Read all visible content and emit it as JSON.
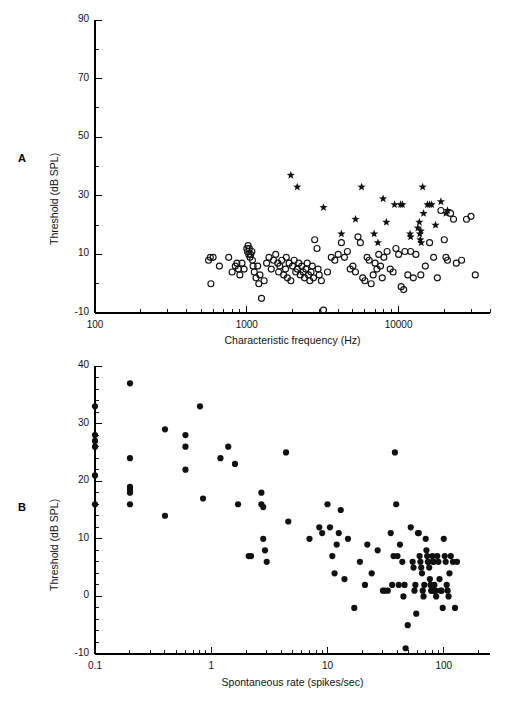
{
  "figure": {
    "panels": [
      {
        "letter": "A",
        "chart_index": 0
      },
      {
        "letter": "B",
        "chart_index": 1
      }
    ]
  },
  "chart_data": [
    {
      "type": "scatter",
      "panel": "A",
      "title": "",
      "xlabel": "Characteristic frequency (Hz)",
      "ylabel": "Threshold (dB SPL)",
      "xscale": "log",
      "yscale": "linear",
      "xlim": [
        100,
        40000
      ],
      "ylim": [
        -10,
        90
      ],
      "xticks": [
        100,
        1000,
        10000
      ],
      "xticklabels": [
        "100",
        "1000",
        "10000"
      ],
      "yticks": [
        -10,
        10,
        30,
        50,
        70,
        90
      ],
      "yticklabels": [
        "-10",
        "10",
        "30",
        "50",
        "70",
        "90"
      ],
      "yminor_step": 10,
      "grid": false,
      "legend": "none",
      "series": [
        {
          "name": "open-circle",
          "marker": "open-circle",
          "points": [
            [
              560,
              8
            ],
            [
              575,
              9
            ],
            [
              580,
              0
            ],
            [
              600,
              9
            ],
            [
              660,
              6
            ],
            [
              760,
              9
            ],
            [
              800,
              4
            ],
            [
              840,
              6
            ],
            [
              860,
              7
            ],
            [
              880,
              5
            ],
            [
              900,
              3
            ],
            [
              930,
              7
            ],
            [
              960,
              5
            ],
            [
              1000,
              12
            ],
            [
              1010,
              11
            ],
            [
              1020,
              13
            ],
            [
              1030,
              10
            ],
            [
              1040,
              12
            ],
            [
              1050,
              9
            ],
            [
              1060,
              10
            ],
            [
              1080,
              11
            ],
            [
              1090,
              8
            ],
            [
              1100,
              6
            ],
            [
              1120,
              4
            ],
            [
              1150,
              2
            ],
            [
              1180,
              6
            ],
            [
              1200,
              0
            ],
            [
              1220,
              3
            ],
            [
              1250,
              -5
            ],
            [
              1300,
              1
            ],
            [
              1350,
              7
            ],
            [
              1400,
              9
            ],
            [
              1450,
              5
            ],
            [
              1500,
              8
            ],
            [
              1550,
              10
            ],
            [
              1600,
              7
            ],
            [
              1620,
              4
            ],
            [
              1650,
              6
            ],
            [
              1700,
              8
            ],
            [
              1750,
              3
            ],
            [
              1800,
              5
            ],
            [
              1820,
              9
            ],
            [
              1850,
              2
            ],
            [
              1900,
              7
            ],
            [
              1950,
              1
            ],
            [
              2000,
              6
            ],
            [
              2050,
              8
            ],
            [
              2100,
              4
            ],
            [
              2150,
              5
            ],
            [
              2200,
              7
            ],
            [
              2250,
              3
            ],
            [
              2300,
              6
            ],
            [
              2350,
              4
            ],
            [
              2400,
              2
            ],
            [
              2450,
              5
            ],
            [
              2500,
              7
            ],
            [
              2550,
              3
            ],
            [
              2600,
              1
            ],
            [
              2650,
              4
            ],
            [
              2700,
              6
            ],
            [
              2750,
              2
            ],
            [
              2800,
              15
            ],
            [
              2900,
              12
            ],
            [
              2950,
              5
            ],
            [
              3000,
              3
            ],
            [
              3100,
              1
            ],
            [
              3200,
              -9
            ],
            [
              3400,
              4
            ],
            [
              3600,
              9
            ],
            [
              3800,
              8
            ],
            [
              4000,
              10
            ],
            [
              4200,
              14
            ],
            [
              4400,
              9
            ],
            [
              4600,
              11
            ],
            [
              4800,
              5
            ],
            [
              5000,
              6
            ],
            [
              5200,
              4
            ],
            [
              5400,
              16
            ],
            [
              5600,
              14
            ],
            [
              5800,
              2
            ],
            [
              6000,
              1
            ],
            [
              6200,
              9
            ],
            [
              6400,
              8
            ],
            [
              6600,
              0
            ],
            [
              6800,
              3
            ],
            [
              7000,
              7
            ],
            [
              7200,
              5
            ],
            [
              7400,
              10
            ],
            [
              7600,
              6
            ],
            [
              7800,
              2
            ],
            [
              8000,
              9
            ],
            [
              8400,
              11
            ],
            [
              8800,
              5
            ],
            [
              9200,
              4
            ],
            [
              9600,
              12
            ],
            [
              10000,
              10
            ],
            [
              10400,
              -1
            ],
            [
              10800,
              -2
            ],
            [
              11000,
              11
            ],
            [
              11500,
              3
            ],
            [
              12000,
              11
            ],
            [
              12500,
              2
            ],
            [
              13000,
              10
            ],
            [
              14000,
              3
            ],
            [
              15000,
              6
            ],
            [
              16000,
              14
            ],
            [
              17000,
              9
            ],
            [
              18000,
              2
            ],
            [
              19000,
              25
            ],
            [
              20000,
              15
            ],
            [
              20500,
              9
            ],
            [
              21000,
              8
            ],
            [
              22000,
              24
            ],
            [
              23000,
              22
            ],
            [
              24000,
              7
            ],
            [
              26000,
              8
            ],
            [
              28000,
              22
            ],
            [
              30000,
              23
            ],
            [
              32000,
              3
            ]
          ]
        },
        {
          "name": "star",
          "marker": "star",
          "points": [
            [
              1950,
              37
            ],
            [
              2150,
              33
            ],
            [
              3200,
              26
            ],
            [
              4200,
              17
            ],
            [
              5200,
              22
            ],
            [
              5700,
              33
            ],
            [
              6900,
              17
            ],
            [
              7300,
              14
            ],
            [
              7900,
              29
            ],
            [
              8300,
              21
            ],
            [
              9400,
              27
            ],
            [
              10300,
              27
            ],
            [
              10600,
              27
            ],
            [
              11900,
              17
            ],
            [
              12000,
              16
            ],
            [
              13400,
              19
            ],
            [
              13700,
              21
            ],
            [
              13800,
              17
            ],
            [
              13900,
              15
            ],
            [
              14000,
              18
            ],
            [
              14100,
              14
            ],
            [
              14400,
              33
            ],
            [
              14600,
              24
            ],
            [
              15500,
              27
            ],
            [
              16000,
              27
            ],
            [
              16500,
              27
            ],
            [
              17500,
              20
            ],
            [
              19000,
              28
            ],
            [
              20500,
              24
            ],
            [
              21000,
              25
            ]
          ]
        }
      ]
    },
    {
      "type": "scatter",
      "panel": "B",
      "title": "",
      "xlabel": "Spontaneous rate (spikes/sec)",
      "ylabel": "Threshold (dB SPL)",
      "xscale": "log",
      "yscale": "linear",
      "xlim": [
        0.1,
        250
      ],
      "ylim": [
        -10,
        40
      ],
      "xticks": [
        0.1,
        1,
        10,
        100
      ],
      "xticklabels": [
        "0.1",
        "1",
        "10",
        "100"
      ],
      "yticks": [
        -10,
        0,
        10,
        20,
        30,
        40
      ],
      "yticklabels": [
        "-10",
        "0",
        "10",
        "20",
        "30",
        "40"
      ],
      "yminor_step": 2,
      "grid": false,
      "legend": "none",
      "series": [
        {
          "name": "filled-circle",
          "marker": "filled-circle",
          "points": [
            [
              0.1,
              33
            ],
            [
              0.1,
              28
            ],
            [
              0.1,
              27
            ],
            [
              0.1,
              26
            ],
            [
              0.1,
              21
            ],
            [
              0.1,
              16
            ],
            [
              0.2,
              37
            ],
            [
              0.2,
              24
            ],
            [
              0.2,
              19
            ],
            [
              0.2,
              18.5
            ],
            [
              0.2,
              18
            ],
            [
              0.2,
              16
            ],
            [
              0.4,
              29
            ],
            [
              0.4,
              14
            ],
            [
              0.6,
              28
            ],
            [
              0.6,
              26
            ],
            [
              0.6,
              22
            ],
            [
              0.8,
              33
            ],
            [
              0.85,
              17
            ],
            [
              1.2,
              24
            ],
            [
              1.4,
              26
            ],
            [
              1.6,
              23
            ],
            [
              1.7,
              16
            ],
            [
              2.1,
              7
            ],
            [
              2.2,
              7
            ],
            [
              2.7,
              18
            ],
            [
              2.7,
              16
            ],
            [
              2.8,
              15.5
            ],
            [
              2.8,
              10
            ],
            [
              2.9,
              8
            ],
            [
              3.0,
              6
            ],
            [
              4.4,
              25
            ],
            [
              4.6,
              13
            ],
            [
              7.0,
              10
            ],
            [
              8.5,
              12
            ],
            [
              9.0,
              11
            ],
            [
              10.0,
              16
            ],
            [
              10.5,
              12
            ],
            [
              11.0,
              7
            ],
            [
              11.5,
              4
            ],
            [
              12.0,
              9
            ],
            [
              12.5,
              11
            ],
            [
              13.0,
              15
            ],
            [
              14.0,
              3
            ],
            [
              15.0,
              10
            ],
            [
              17.0,
              -2
            ],
            [
              19.0,
              6
            ],
            [
              21.0,
              2
            ],
            [
              22.0,
              9
            ],
            [
              24.0,
              4
            ],
            [
              27.0,
              8
            ],
            [
              30.0,
              1
            ],
            [
              31.0,
              1
            ],
            [
              33.0,
              1
            ],
            [
              35.0,
              11
            ],
            [
              36.0,
              2
            ],
            [
              37.0,
              7
            ],
            [
              38.0,
              25
            ],
            [
              39.0,
              16
            ],
            [
              40.0,
              7
            ],
            [
              41.0,
              2
            ],
            [
              42.0,
              9
            ],
            [
              44.0,
              6
            ],
            [
              45.0,
              0
            ],
            [
              46.0,
              2
            ],
            [
              47.0,
              -9
            ],
            [
              49.0,
              -5
            ],
            [
              52.0,
              12
            ],
            [
              54.0,
              6
            ],
            [
              55.0,
              5
            ],
            [
              56.0,
              1
            ],
            [
              57.0,
              2
            ],
            [
              58.0,
              -3
            ],
            [
              60.0,
              11
            ],
            [
              61.0,
              11
            ],
            [
              62.0,
              7
            ],
            [
              63.0,
              6
            ],
            [
              64.0,
              5
            ],
            [
              65.0,
              4
            ],
            [
              66.0,
              1
            ],
            [
              67.0,
              0
            ],
            [
              68.0,
              2
            ],
            [
              70.0,
              10
            ],
            [
              71.0,
              8
            ],
            [
              72.0,
              7
            ],
            [
              73.0,
              6
            ],
            [
              74.0,
              6
            ],
            [
              75.0,
              5
            ],
            [
              76.0,
              3
            ],
            [
              77.0,
              2
            ],
            [
              78.0,
              1
            ],
            [
              79.0,
              1
            ],
            [
              80.0,
              7
            ],
            [
              81.0,
              6
            ],
            [
              82.0,
              6
            ],
            [
              83.0,
              2
            ],
            [
              84.0,
              1
            ],
            [
              85.0,
              1
            ],
            [
              86.0,
              0
            ],
            [
              88.0,
              7
            ],
            [
              90.0,
              6
            ],
            [
              92.0,
              3
            ],
            [
              94.0,
              1
            ],
            [
              96.0,
              1
            ],
            [
              98.0,
              -2
            ],
            [
              100.0,
              10
            ],
            [
              102.0,
              7
            ],
            [
              104.0,
              6
            ],
            [
              106.0,
              2
            ],
            [
              108.0,
              1
            ],
            [
              110.0,
              0
            ],
            [
              112.0,
              4
            ],
            [
              115.0,
              7
            ],
            [
              120.0,
              6
            ],
            [
              125.0,
              -2
            ],
            [
              130.0,
              6
            ]
          ]
        }
      ]
    }
  ]
}
